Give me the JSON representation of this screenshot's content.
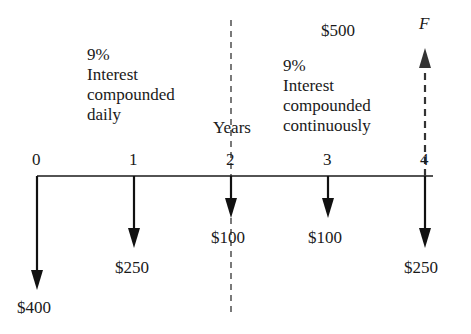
{
  "diagram": {
    "type": "cash-flow-diagram",
    "axis_label": "Years",
    "ticks": [
      "0",
      "1",
      "2",
      "3",
      "4"
    ],
    "period1_note": {
      "rate": "9%",
      "line2": "Interest",
      "line3": "compounded",
      "line4": "daily"
    },
    "period2_note": {
      "rate": "9%",
      "line2": "Interest",
      "line3": "compounded",
      "line4": "continuously"
    },
    "top_amount": "$500",
    "future_value_label": "F",
    "cash_flows": [
      {
        "year": 0,
        "direction": "down",
        "label": "$400"
      },
      {
        "year": 1,
        "direction": "down",
        "label": "$250"
      },
      {
        "year": 2,
        "direction": "down",
        "label": "$100"
      },
      {
        "year": 3,
        "direction": "down",
        "label": "$100"
      },
      {
        "year": 4,
        "direction": "down",
        "label": "$250"
      },
      {
        "year": 4,
        "direction": "up",
        "style": "dashed",
        "label": "F"
      }
    ],
    "divider": {
      "at_year": 2,
      "style": "dashed"
    },
    "colors": {
      "ink": "#1a1a1a",
      "dashed_arrow": "#333333"
    }
  }
}
